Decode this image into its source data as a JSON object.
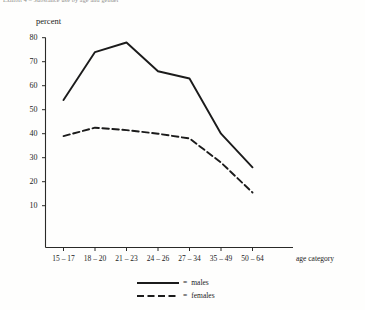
{
  "caption": "Exhibit 4 – Substance use by age and gender",
  "chart_data": {
    "type": "line",
    "title": "",
    "xlabel": "age category",
    "ylabel": "percent",
    "categories": [
      "15 – 17",
      "18 – 20",
      "21 – 23",
      "24 – 26",
      "27 – 34",
      "35 – 49",
      "50 – 64"
    ],
    "series": [
      {
        "name": "males",
        "values": [
          54,
          74,
          78,
          66,
          63,
          40,
          26
        ],
        "style": "solid",
        "color": "#1b1b1b"
      },
      {
        "name": "females",
        "values": [
          39,
          42.5,
          41.5,
          40,
          38,
          28,
          15.5
        ],
        "style": "dashed",
        "color": "#1b1b1b"
      }
    ],
    "ylim": [
      0,
      80
    ],
    "yticks": [
      10,
      20,
      30,
      40,
      50,
      60,
      70,
      80
    ],
    "ytick_labels": [
      "10",
      "20",
      "30",
      "40",
      "50",
      "60",
      "70",
      "80"
    ],
    "grid": false,
    "legend_position": "bottom-center"
  },
  "legend": {
    "equals": "=",
    "entries": [
      {
        "label": "males",
        "style": "solid"
      },
      {
        "label": "females",
        "style": "dashed"
      }
    ]
  }
}
